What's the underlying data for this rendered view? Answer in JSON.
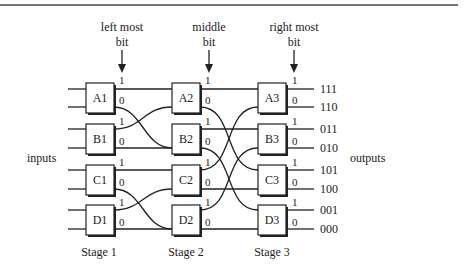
{
  "header_rule": true,
  "bit_labels": [
    {
      "line1": "left most",
      "line2": "bit",
      "x": 122
    },
    {
      "line1": "middle",
      "line2": "bit",
      "x": 209
    },
    {
      "line1": "right most",
      "line2": "bit",
      "x": 294
    }
  ],
  "side_labels": {
    "inputs": "inputs",
    "outputs": "outputs"
  },
  "stages": [
    {
      "label": "Stage 1",
      "x": 86,
      "switches": [
        "A1",
        "B1",
        "C1",
        "D1"
      ]
    },
    {
      "label": "Stage 2",
      "x": 172,
      "switches": [
        "A2",
        "B2",
        "C2",
        "D2"
      ]
    },
    {
      "label": "Stage 3",
      "x": 258,
      "switches": [
        "A3",
        "B3",
        "C3",
        "D3"
      ]
    }
  ],
  "port_labels": {
    "upper": "1",
    "lower": "0"
  },
  "outputs": [
    "111",
    "110",
    "011",
    "010",
    "101",
    "100",
    "001",
    "000"
  ],
  "connections": {
    "stage1_to_stage2": [
      {
        "from": "A1.1",
        "to": "A2.in0"
      },
      {
        "from": "A1.0",
        "to": "B2.in0"
      },
      {
        "from": "B1.1",
        "to": "A2.in1"
      },
      {
        "from": "B1.0",
        "to": "B2.in1"
      },
      {
        "from": "C1.1",
        "to": "C2.in0"
      },
      {
        "from": "C1.0",
        "to": "D2.in0"
      },
      {
        "from": "D1.1",
        "to": "C2.in1"
      },
      {
        "from": "D1.0",
        "to": "D2.in1"
      }
    ],
    "stage2_to_stage3": [
      {
        "from": "A2.1",
        "to": "A3.in0"
      },
      {
        "from": "A2.0",
        "to": "C3.in0"
      },
      {
        "from": "B2.1",
        "to": "B3.in0"
      },
      {
        "from": "B2.0",
        "to": "D3.in0"
      },
      {
        "from": "C2.1",
        "to": "A3.in1"
      },
      {
        "from": "C2.0",
        "to": "C3.in1"
      },
      {
        "from": "D2.1",
        "to": "B3.in1"
      },
      {
        "from": "D2.0",
        "to": "D3.in1"
      }
    ]
  }
}
